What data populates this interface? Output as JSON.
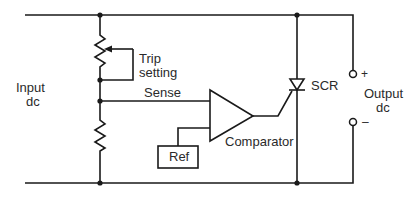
{
  "diagram": {
    "type": "circuit-schematic",
    "labels": {
      "input_line1": "Input",
      "input_line2": "dc",
      "trip_line1": "Trip",
      "trip_line2": "setting",
      "sense": "Sense",
      "ref": "Ref",
      "comparator": "Comparator",
      "scr": "SCR",
      "output_line1": "Output",
      "output_line2": "dc",
      "plus": "+",
      "minus": "–"
    },
    "components": [
      {
        "id": "trip-pot",
        "kind": "potentiometer",
        "label": "Trip setting"
      },
      {
        "id": "lower-resistor",
        "kind": "resistor"
      },
      {
        "id": "comparator",
        "kind": "op-amp/comparator",
        "label": "Comparator"
      },
      {
        "id": "ref",
        "kind": "reference-block",
        "label": "Ref"
      },
      {
        "id": "scr",
        "kind": "thyristor",
        "label": "SCR"
      },
      {
        "id": "out-plus",
        "kind": "terminal",
        "label": "+"
      },
      {
        "id": "out-minus",
        "kind": "terminal",
        "label": "–"
      }
    ],
    "colors": {
      "line": "#1a1a1a",
      "text": "#2a2a2a",
      "background": "#ffffff"
    }
  }
}
